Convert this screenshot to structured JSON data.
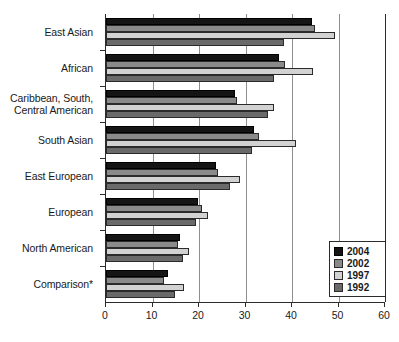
{
  "chart_data": {
    "type": "bar",
    "orientation": "horizontal",
    "title": "",
    "xlabel": "",
    "ylabel": "",
    "xlim": [
      0,
      60
    ],
    "xticks": [
      0,
      10,
      20,
      30,
      40,
      50,
      60
    ],
    "xticklabels": [
      "0",
      "10",
      "20",
      "30",
      "40",
      "50",
      "60"
    ],
    "grid": "vertical",
    "legend_position": "bottom-right",
    "categories": [
      "East Asian",
      "African",
      "Caribbean, South,\nCentral American",
      "South Asian",
      "East European",
      "European",
      "North American",
      "Comparison*"
    ],
    "series": [
      {
        "name": "2004",
        "color": "#151515",
        "values": [
          44.3,
          37.2,
          27.7,
          31.8,
          23.6,
          19.7,
          15.9,
          13.3
        ]
      },
      {
        "name": "2002",
        "color": "#8a8a8a",
        "values": [
          45.0,
          38.6,
          28.2,
          32.8,
          24.1,
          20.6,
          15.5,
          12.5
        ]
      },
      {
        "name": "1997",
        "color": "#d2d2d2",
        "values": [
          49.2,
          44.6,
          36.1,
          40.9,
          28.8,
          21.9,
          17.9,
          16.8
        ]
      },
      {
        "name": "1992",
        "color": "#6a6a6a",
        "values": [
          38.3,
          36.1,
          34.8,
          31.4,
          26.7,
          19.4,
          16.5,
          14.8
        ]
      }
    ],
    "legend_entries": [
      "2004",
      "2002",
      "1997",
      "1992"
    ]
  },
  "colors": {
    "series_2004": "#151515",
    "series_2002": "#8a8a8a",
    "series_1997": "#d2d2d2",
    "series_1992": "#6a6a6a",
    "axis": "#2b2b2b",
    "gridline": "#8e8e8e",
    "background": "#ffffff"
  }
}
